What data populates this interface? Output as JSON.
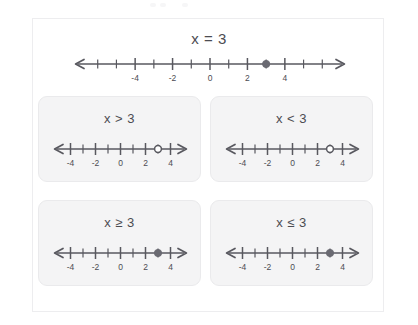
{
  "figure": {
    "headline": "x = 3",
    "axis_color": "#58585f",
    "text_color": "#4c4c52",
    "dot_color": "#6a6a72",
    "card_bg": "#f4f4f5"
  },
  "main_number_line": {
    "name": "number-line-equals",
    "min": -7,
    "max": 7,
    "tick_step": 1,
    "tick_labels": [
      {
        "value": -4,
        "text": "-4"
      },
      {
        "value": -2,
        "text": "-2"
      },
      {
        "value": 0,
        "text": "0"
      },
      {
        "value": 2,
        "text": "2"
      },
      {
        "value": 4,
        "text": "4"
      }
    ],
    "point": {
      "value": 3,
      "style": "filled"
    },
    "arrow_left": true,
    "arrow_right": true
  },
  "cards": [
    {
      "id": "greater-than",
      "label": "x > 3",
      "line": {
        "min": -5,
        "max": 5,
        "tick_step": 1,
        "tick_labels": [
          {
            "value": -4,
            "text": "-4"
          },
          {
            "value": -2,
            "text": "-2"
          },
          {
            "value": 0,
            "text": "0"
          },
          {
            "value": 2,
            "text": "2"
          },
          {
            "value": 4,
            "text": "4"
          }
        ],
        "point": {
          "value": 3,
          "style": "open"
        }
      }
    },
    {
      "id": "less-than",
      "label": "x < 3",
      "line": {
        "min": -5,
        "max": 5,
        "tick_step": 1,
        "tick_labels": [
          {
            "value": -4,
            "text": "-4"
          },
          {
            "value": -2,
            "text": "-2"
          },
          {
            "value": 0,
            "text": "0"
          },
          {
            "value": 2,
            "text": "2"
          },
          {
            "value": 4,
            "text": "4"
          }
        ],
        "point": {
          "value": 3,
          "style": "open"
        }
      }
    },
    {
      "id": "greater-or-equal",
      "label": "x ≥ 3",
      "line": {
        "min": -5,
        "max": 5,
        "tick_step": 1,
        "tick_labels": [
          {
            "value": -4,
            "text": "-4"
          },
          {
            "value": -2,
            "text": "-2"
          },
          {
            "value": 0,
            "text": "0"
          },
          {
            "value": 2,
            "text": "2"
          },
          {
            "value": 4,
            "text": "4"
          }
        ],
        "point": {
          "value": 3,
          "style": "filled"
        }
      }
    },
    {
      "id": "less-or-equal",
      "label": "x ≤ 3",
      "line": {
        "min": -5,
        "max": 5,
        "tick_step": 1,
        "tick_labels": [
          {
            "value": -4,
            "text": "-4"
          },
          {
            "value": -2,
            "text": "-2"
          },
          {
            "value": 0,
            "text": "0"
          },
          {
            "value": 2,
            "text": "2"
          },
          {
            "value": 4,
            "text": "4"
          }
        ],
        "point": {
          "value": 3,
          "style": "filled"
        }
      }
    }
  ]
}
